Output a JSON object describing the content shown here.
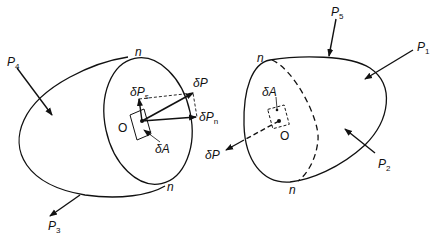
{
  "diagram": {
    "type": "free-body / stress on cut section",
    "left_body": {
      "forces": [
        {
          "name": "P",
          "sub": "4"
        },
        {
          "name": "P",
          "sub": "3"
        }
      ],
      "section_labels": [
        "n",
        "n"
      ],
      "point": "O",
      "area_element": "δA",
      "vectors": [
        {
          "name": "δP",
          "sub": ""
        },
        {
          "name": "δP",
          "sub": "s"
        },
        {
          "name": "δP",
          "sub": "n"
        }
      ]
    },
    "right_body": {
      "forces": [
        {
          "name": "P",
          "sub": "5"
        },
        {
          "name": "P",
          "sub": "1"
        },
        {
          "name": "P",
          "sub": "2"
        }
      ],
      "section_labels": [
        "n",
        "n"
      ],
      "point": "O",
      "area_element": "δA",
      "vectors": [
        {
          "name": "δP",
          "sub": ""
        }
      ]
    }
  },
  "colors": {
    "ink": "#111111",
    "background": "#ffffff"
  }
}
